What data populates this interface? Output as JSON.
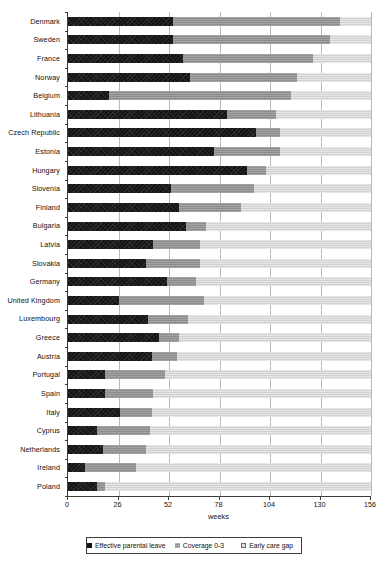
{
  "chart_data": {
    "type": "bar",
    "orientation": "horizontal",
    "stacked": true,
    "title": "",
    "xlabel": "weeks",
    "ylabel": "",
    "xlim": [
      0,
      156
    ],
    "xticks": [
      0,
      26,
      52,
      78,
      104,
      130,
      156
    ],
    "xtick_labels": [
      "0",
      "26",
      "52",
      "78",
      "104",
      "130",
      "156"
    ],
    "grid": "vertical",
    "legend_position": "bottom",
    "categories": [
      "Denmark",
      "Sweden",
      "France",
      "Norway",
      "Belgium",
      "Lithuania",
      "Czech Republic",
      "Estonia",
      "Hungary",
      "Slovenia",
      "Finland",
      "Bulgaria",
      "Latvia",
      "Slovakia",
      "Germany",
      "United Kingdom",
      "Luxembourg",
      "Greece",
      "Austria",
      "Portugal",
      "Spain",
      "Italy",
      "Cyprus",
      "Netherlands",
      "Ireland",
      "Poland"
    ],
    "series": [
      {
        "name": "Effective parental leave",
        "color": "#141414",
        "values": [
          54,
          54,
          59,
          63,
          21,
          82,
          97,
          75,
          92,
          53,
          57,
          61,
          44,
          40,
          51,
          26,
          41,
          47,
          43,
          19,
          19,
          27,
          15,
          18,
          9,
          15
        ]
      },
      {
        "name": "Coverage 0-3",
        "color": "#8e8e8e",
        "values": [
          86,
          81,
          67,
          55,
          94,
          25,
          12,
          34,
          10,
          43,
          32,
          10,
          24,
          28,
          15,
          44,
          21,
          10,
          13,
          31,
          25,
          16,
          27,
          22,
          26,
          4
        ]
      },
      {
        "name": "Early care gap",
        "color": "#d2d2d2",
        "values": [
          16,
          21,
          30,
          38,
          41,
          49,
          47,
          47,
          54,
          60,
          67,
          85,
          88,
          88,
          90,
          86,
          94,
          99,
          100,
          106,
          112,
          113,
          114,
          116,
          121,
          137
        ]
      }
    ]
  },
  "axis": {
    "x_title": "weeks"
  },
  "legend": {
    "items": [
      {
        "label": "Effective parental leave",
        "swatch": "black-square-icon"
      },
      {
        "label": "Coverage 0-3",
        "swatch": "grey-square-icon"
      },
      {
        "label": "Early care gap",
        "swatch": "light-square-icon"
      }
    ]
  }
}
